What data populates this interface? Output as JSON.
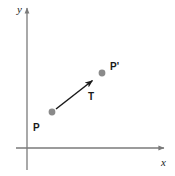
{
  "figure": {
    "type": "vector-translation-diagram",
    "background_color": "#ffffff",
    "axes": {
      "x_label": "x",
      "y_label": "y",
      "axis_color": "#7a7a7a",
      "origin": {
        "x": 27,
        "y": 148
      },
      "x_axis": {
        "x1": 16,
        "y1": 148,
        "x2": 166,
        "y2": 148
      },
      "y_axis": {
        "x1": 27,
        "y1": 170,
        "x2": 27,
        "y2": 6
      },
      "x_label_pos": {
        "x": 161,
        "y": 166
      },
      "y_label_pos": {
        "x": 17,
        "y": 13
      }
    },
    "points": [
      {
        "name": "P",
        "label": "P",
        "color": "#8a8a8a",
        "radius": 3.4,
        "cx": 52,
        "cy": 112,
        "label_x": 33,
        "label_y": 131
      },
      {
        "name": "P-prime",
        "label": "P'",
        "color": "#8a8a8a",
        "radius": 3.4,
        "cx": 102,
        "cy": 73,
        "label_x": 110,
        "label_y": 70
      }
    ],
    "vector": {
      "name": "T",
      "label": "T",
      "color": "#1a1a1a",
      "x1": 56,
      "y1": 109,
      "x2": 96,
      "y2": 78,
      "label_x": 88,
      "label_y": 100
    }
  }
}
